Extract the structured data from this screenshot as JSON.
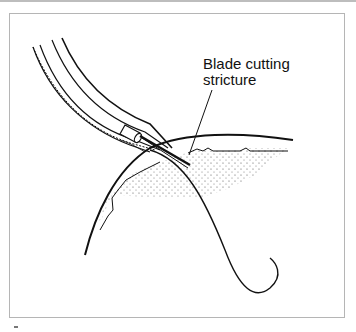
{
  "figure": {
    "annotation": {
      "line1": "Blade cutting",
      "line2": "stricture"
    },
    "style": {
      "ink_color": "#111111",
      "frame_color": "#b5b5b5",
      "stipple_color": "#555555"
    },
    "elements": [
      "endoscope-sheath",
      "cutting-blade",
      "guidewire",
      "tissue-wall",
      "stricture-tissue",
      "leader-line"
    ]
  }
}
